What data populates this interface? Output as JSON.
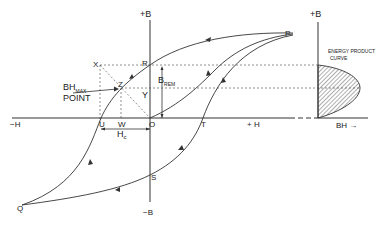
{
  "diagram": {
    "type": "hysteresis-loop-with-energy-product-curve",
    "axes": {
      "plus_b": "+B",
      "minus_b": "−B",
      "plus_h": "+ H",
      "minus_h": "−H",
      "energy_plus_b": "+B",
      "bh_axis": "BH →"
    },
    "points": {
      "origin": "O",
      "p": "P",
      "q": "Q",
      "r": "R",
      "s": "S",
      "t": "T",
      "u": "U",
      "w": "W",
      "x": "X",
      "y": "Y",
      "z": "Z"
    },
    "annotations": {
      "bh_max_main": "BH",
      "bh_max_sub": "MAX",
      "bh_max_point": "POINT",
      "b_rem_main": "B",
      "b_rem_sub": "REM",
      "hc_main": "H",
      "hc_sub": "c",
      "energy_curve_line1": "ENERGY PRODUCT",
      "energy_curve_line2": "CURVE"
    },
    "colors": {
      "line": "#333333",
      "background": "#ffffff"
    }
  }
}
